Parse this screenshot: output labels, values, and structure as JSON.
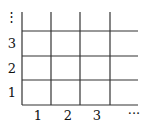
{
  "diagram": {
    "type": "grid",
    "y_axis": {
      "labels": [
        "1",
        "2",
        "3"
      ],
      "continuation": "⋮"
    },
    "x_axis": {
      "labels": [
        "1",
        "2",
        "3"
      ],
      "continuation": "···"
    },
    "line_color": "#333333",
    "text_color": "#111111"
  }
}
